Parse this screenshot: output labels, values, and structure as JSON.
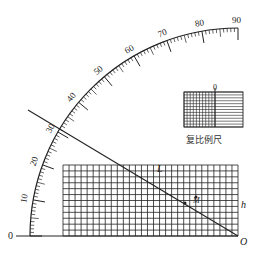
{
  "diagram": {
    "type": "sine-bar / quadrant scale diagram",
    "arc_scale": {
      "labels": [
        "10",
        "20",
        "30",
        "40",
        "50",
        "60",
        "70",
        "80",
        "90"
      ],
      "zero_label": "0",
      "range_deg": [
        0,
        90
      ],
      "major_step": 10,
      "minor_step": 1
    },
    "grid": {
      "label_top": "L",
      "label_right": "h",
      "columns": 29,
      "rows": 12
    },
    "origin_label": "O",
    "point_label": "M",
    "inset": {
      "zero_label": "0",
      "caption": "复比例尺"
    },
    "colors": {
      "ink": "#222222",
      "background": "#ffffff"
    }
  }
}
